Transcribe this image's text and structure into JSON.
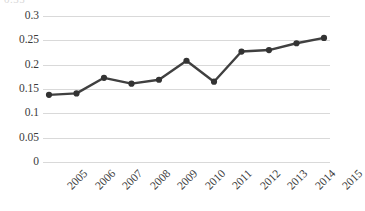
{
  "chart_data": {
    "type": "line",
    "title": "",
    "subtitle": "",
    "xlabel": "",
    "ylabel": "",
    "categories": [
      "2005",
      "2006",
      "2007",
      "2008",
      "2009",
      "2010",
      "2011",
      "2012",
      "2013",
      "2014",
      "2015"
    ],
    "values": [
      0.138,
      0.141,
      0.173,
      0.161,
      0.169,
      0.208,
      0.165,
      0.227,
      0.23,
      0.244,
      0.255
    ],
    "series": [
      {
        "name": "series-1",
        "values": [
          0.138,
          0.141,
          0.173,
          0.161,
          0.169,
          0.208,
          0.165,
          0.227,
          0.23,
          0.244,
          0.255
        ]
      }
    ],
    "ylim": [
      0,
      0.3
    ],
    "ytick_labels": [
      "0.3",
      "0.25",
      "0.2",
      "0.15",
      "0.1",
      "0.05",
      "0"
    ],
    "ytick_values": [
      0.3,
      0.25,
      0.2,
      0.15,
      0.1,
      0.05,
      0
    ],
    "xtick_labels": [
      "2005",
      "2006",
      "2007",
      "2008",
      "2009",
      "2010",
      "2011",
      "2012",
      "2013",
      "2014",
      "2015"
    ],
    "grid": "horizontal",
    "legend": "none",
    "annotations": [],
    "colors": {
      "line": "#404040",
      "marker": "#333333",
      "gridline": "#d9d9d9",
      "text": "#3a3a3a",
      "background": "#ffffff"
    },
    "clipped_top_label": "0.35"
  }
}
